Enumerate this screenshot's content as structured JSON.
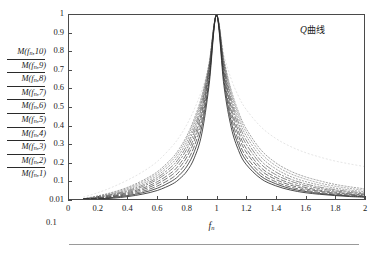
{
  "figure": {
    "annotation": {
      "symbol": "Q",
      "text": "曲线",
      "full": "Q曲线"
    },
    "xaxis_title_base": "f",
    "xaxis_title_sub": "n",
    "lower_origin_label": "0.1"
  },
  "axes": {
    "x_ticks": [
      "0",
      "0.2",
      "0.4",
      "0.6",
      "0.8",
      "1",
      "1.2",
      "1.4",
      "1.6",
      "1.8",
      "2"
    ],
    "x_tick_values": [
      0,
      0.2,
      0.4,
      0.6,
      0.8,
      1.0,
      1.2,
      1.4,
      1.6,
      1.8,
      2.0
    ],
    "y_ticks": [
      "1",
      "0.9",
      "0.8",
      "0.7",
      "0.6",
      "0.5",
      "0.4",
      "0.3",
      "0.2",
      "0.1",
      "0.01"
    ],
    "y_tick_values": [
      1,
      0.9,
      0.8,
      0.7,
      0.6,
      0.5,
      0.4,
      0.3,
      0.2,
      0.1,
      0.01
    ]
  },
  "y_series_labels": [
    {
      "base": "M",
      "arg": "f",
      "sub": "n",
      "index": "10",
      "text": "M(f n,10)"
    },
    {
      "base": "M",
      "arg": "f",
      "sub": "n",
      "index": "9",
      "text": "M(f n,9)"
    },
    {
      "base": "M",
      "arg": "f",
      "sub": "n",
      "index": "8",
      "text": "M(f n,8)"
    },
    {
      "base": "M",
      "arg": "f",
      "sub": "n",
      "index": "7",
      "text": "M(f n,7)"
    },
    {
      "base": "M",
      "arg": "f",
      "sub": "n",
      "index": "6",
      "text": "M(f n,6)"
    },
    {
      "base": "M",
      "arg": "f",
      "sub": "n",
      "index": "5",
      "text": "M(f n,5)"
    },
    {
      "base": "M",
      "arg": "f",
      "sub": "n",
      "index": "4",
      "text": "M(f n,4)"
    },
    {
      "base": "M",
      "arg": "f",
      "sub": "n",
      "index": "3",
      "text": "M(f n,3)"
    },
    {
      "base": "M",
      "arg": "f",
      "sub": "n",
      "index": "2",
      "text": "M(f n,2)"
    },
    {
      "base": "M",
      "arg": "f",
      "sub": "n",
      "index": "1",
      "text": "M(f n,1)"
    }
  ],
  "chart_data": {
    "type": "line",
    "title": "Q曲线",
    "xlabel": "f_n",
    "ylabel": "M(f_n, k)",
    "xlim": [
      0,
      2
    ],
    "ylim": [
      0.01,
      1
    ],
    "grid": false,
    "legend": "left-axis-stack",
    "x_ticks": [
      0,
      0.2,
      0.4,
      0.6,
      0.8,
      1.0,
      1.2,
      1.4,
      1.6,
      1.8,
      2.0
    ],
    "y_ticks": [
      0.01,
      0.1,
      0.2,
      0.3,
      0.4,
      0.5,
      0.6,
      0.7,
      0.8,
      0.9,
      1.0
    ],
    "note": "Normalized magnification / resonance (Q) curves. Each series k has damping ratio zeta_k; all peak at f_n = 1 with M = 1.",
    "x": [
      0.1,
      0.2,
      0.3,
      0.4,
      0.5,
      0.6,
      0.7,
      0.75,
      0.8,
      0.85,
      0.9,
      0.95,
      1.0,
      1.05,
      1.1,
      1.15,
      1.2,
      1.3,
      1.4,
      1.5,
      1.6,
      1.7,
      1.8,
      1.9,
      2.0
    ],
    "series": [
      {
        "name": "M(f_n,1)",
        "k": 1,
        "zeta": 0.5,
        "style": "dotted",
        "color": "#6f6f6f",
        "values": [
          0.012,
          0.026,
          0.044,
          0.068,
          0.101,
          0.149,
          0.223,
          0.276,
          0.345,
          0.438,
          0.56,
          0.74,
          1.0,
          0.76,
          0.592,
          0.472,
          0.384,
          0.268,
          0.198,
          0.152,
          0.121,
          0.099,
          0.082,
          0.07,
          0.06
        ]
      },
      {
        "name": "M(f_n,2)",
        "k": 2,
        "zeta": 0.42,
        "style": "dotted",
        "color": "#7a7a7a",
        "values": [
          0.011,
          0.024,
          0.041,
          0.063,
          0.094,
          0.139,
          0.21,
          0.262,
          0.331,
          0.424,
          0.549,
          0.734,
          1.0,
          0.753,
          0.579,
          0.456,
          0.366,
          0.25,
          0.182,
          0.138,
          0.109,
          0.088,
          0.073,
          0.062,
          0.053
        ]
      },
      {
        "name": "M(f_n,3)",
        "k": 3,
        "zeta": 0.35,
        "style": "dotted",
        "color": "#6a6a6a",
        "values": [
          0.01,
          0.022,
          0.037,
          0.058,
          0.086,
          0.128,
          0.195,
          0.245,
          0.313,
          0.406,
          0.535,
          0.727,
          1.0,
          0.744,
          0.562,
          0.436,
          0.345,
          0.23,
          0.165,
          0.123,
          0.096,
          0.078,
          0.064,
          0.054,
          0.046
        ]
      },
      {
        "name": "M(f_n,4)",
        "k": 4,
        "zeta": 0.29,
        "style": "dashdot",
        "color": "#5e5e5e",
        "values": [
          0.009,
          0.02,
          0.034,
          0.052,
          0.078,
          0.117,
          0.179,
          0.227,
          0.293,
          0.386,
          0.518,
          0.719,
          1.0,
          0.733,
          0.543,
          0.413,
          0.322,
          0.209,
          0.148,
          0.109,
          0.085,
          0.068,
          0.056,
          0.047,
          0.04
        ]
      },
      {
        "name": "M(f_n,5)",
        "k": 5,
        "zeta": 0.24,
        "style": "dashdot",
        "color": "#555555",
        "values": [
          0.008,
          0.018,
          0.031,
          0.047,
          0.071,
          0.107,
          0.164,
          0.21,
          0.273,
          0.365,
          0.5,
          0.71,
          1.0,
          0.721,
          0.523,
          0.391,
          0.3,
          0.191,
          0.133,
          0.098,
          0.076,
          0.061,
          0.05,
          0.042,
          0.035
        ]
      },
      {
        "name": "M(f_n,6)",
        "k": 6,
        "zeta": 0.19,
        "style": "dashed",
        "color": "#4d4d4d",
        "values": [
          0.007,
          0.016,
          0.027,
          0.042,
          0.063,
          0.095,
          0.147,
          0.19,
          0.25,
          0.34,
          0.476,
          0.698,
          1.0,
          0.706,
          0.498,
          0.365,
          0.276,
          0.172,
          0.119,
          0.087,
          0.067,
          0.053,
          0.044,
          0.036,
          0.031
        ]
      },
      {
        "name": "M(f_n,7)",
        "k": 7,
        "zeta": 0.15,
        "style": "dashed",
        "color": "#454545",
        "values": [
          0.006,
          0.014,
          0.024,
          0.037,
          0.056,
          0.085,
          0.132,
          0.172,
          0.229,
          0.317,
          0.454,
          0.686,
          1.0,
          0.691,
          0.476,
          0.342,
          0.256,
          0.157,
          0.107,
          0.078,
          0.06,
          0.048,
          0.039,
          0.033,
          0.027
        ]
      },
      {
        "name": "M(f_n,8)",
        "k": 8,
        "zeta": 0.11,
        "style": "dashed",
        "color": "#3d3d3d",
        "values": [
          0.005,
          0.012,
          0.021,
          0.032,
          0.048,
          0.074,
          0.115,
          0.151,
          0.204,
          0.288,
          0.424,
          0.668,
          1.0,
          0.671,
          0.448,
          0.315,
          0.232,
          0.14,
          0.095,
          0.069,
          0.053,
          0.042,
          0.034,
          0.029,
          0.024
        ]
      },
      {
        "name": "M(f_n,9)",
        "k": 9,
        "zeta": 0.075,
        "style": "solid",
        "color": "#333333",
        "values": [
          0.004,
          0.01,
          0.018,
          0.027,
          0.041,
          0.063,
          0.099,
          0.131,
          0.179,
          0.258,
          0.392,
          0.646,
          1.0,
          0.647,
          0.419,
          0.29,
          0.211,
          0.125,
          0.085,
          0.061,
          0.047,
          0.037,
          0.03,
          0.025,
          0.021
        ]
      },
      {
        "name": "M(f_n,10)",
        "k": 10,
        "zeta": 0.045,
        "style": "solid",
        "color": "#2a2a2a",
        "values": [
          0.003,
          0.008,
          0.014,
          0.022,
          0.034,
          0.052,
          0.083,
          0.11,
          0.152,
          0.224,
          0.354,
          0.62,
          1.0,
          0.618,
          0.388,
          0.263,
          0.189,
          0.111,
          0.075,
          0.054,
          0.041,
          0.033,
          0.027,
          0.022,
          0.019
        ]
      },
      {
        "name": "envelope-faint",
        "k": 0,
        "zeta": 0.9,
        "style": "dotted-faint",
        "color": "#c2c2c2",
        "values": [
          0.02,
          0.042,
          0.07,
          0.104,
          0.148,
          0.205,
          0.287,
          0.34,
          0.406,
          0.489,
          0.591,
          0.731,
          1.0,
          0.787,
          0.651,
          0.557,
          0.488,
          0.393,
          0.33,
          0.286,
          0.253,
          0.228,
          0.207,
          0.191,
          0.177
        ]
      }
    ]
  }
}
